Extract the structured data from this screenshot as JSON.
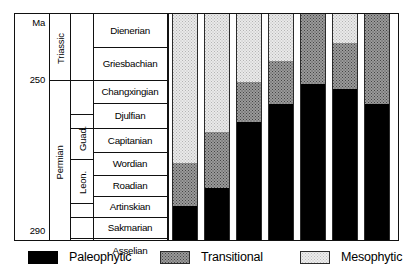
{
  "figure": {
    "axis": {
      "unit_label": "Ma",
      "ticks": [
        "250",
        "290"
      ],
      "range_top_ma": 243.5,
      "range_bottom_ma": 292.0
    },
    "systems": [
      {
        "name": "Triassic",
        "top_ma": 243.5,
        "base_ma": 251.0
      },
      {
        "name": "Permian",
        "top_ma": 251.0,
        "base_ma": 292.0
      }
    ],
    "series": [
      {
        "name": "Guad.",
        "full_name": "Guadalupian",
        "top_ma": 265.0,
        "base_ma": 274.5
      },
      {
        "name": "Leon.",
        "full_name": "Leonardian",
        "top_ma": 274.5,
        "base_ma": 283.5
      }
    ],
    "stages": [
      {
        "name": "Dienerian"
      },
      {
        "name": "Griesbachian"
      },
      {
        "name": "Changxingian"
      },
      {
        "name": "Djulfian"
      },
      {
        "name": "Capitanian"
      },
      {
        "name": "Wordian"
      },
      {
        "name": "Roadian"
      },
      {
        "name": "Artinskian"
      },
      {
        "name": "Sakmarian"
      },
      {
        "name": "Asselian"
      }
    ]
  },
  "chart_data": {
    "type": "bar",
    "title": "",
    "xlabel": "",
    "ylabel": "Ma",
    "orientation": "vertical-stacked",
    "grid": false,
    "legend_position": "bottom",
    "ylim": [
      292,
      243.5
    ],
    "yticks": [
      250,
      290
    ],
    "categories": [
      "Asselian",
      "Sakmarian",
      "Artinskian",
      "Roadian",
      "Wordian",
      "Capitanian",
      "Djulfian"
    ],
    "legend": [
      "Paleophytic",
      "Transitional",
      "Mesophytic"
    ],
    "series": [
      {
        "name": "Paleophytic",
        "values": [
          15,
          23,
          52,
          60,
          69,
          67,
          60
        ]
      },
      {
        "name": "Transitional",
        "values": [
          19,
          25,
          18,
          19,
          31,
          20,
          40
        ]
      },
      {
        "name": "Mesophytic",
        "values": [
          66,
          52,
          30,
          21,
          0,
          13,
          0
        ]
      }
    ],
    "units": "percent"
  },
  "legend": {
    "items": [
      {
        "key": "paleophytic",
        "label": "Paleophytic",
        "color": "#000000",
        "pattern": "solid-black"
      },
      {
        "key": "transitional",
        "label": "Transitional",
        "color": "#9a9a9a",
        "pattern": "dense-stipple"
      },
      {
        "key": "mesophytic",
        "label": "Mesophytic",
        "color": "#ececec",
        "pattern": "light-stipple"
      }
    ]
  }
}
